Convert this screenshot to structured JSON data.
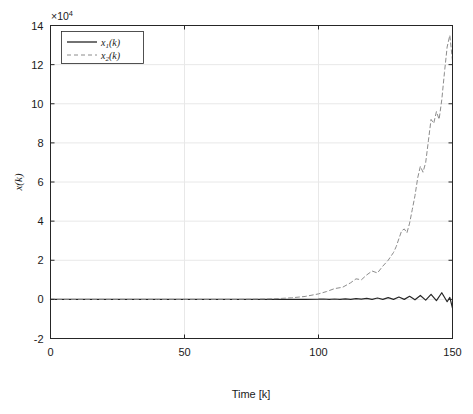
{
  "figure": {
    "background_color": "#ffffff",
    "axes_color": "#262626",
    "grid_color": "#e8e8e8"
  },
  "chart_data": {
    "type": "line",
    "title": "",
    "xlabel": "Time [k]",
    "ylabel": "x(k)",
    "y_exponent_label": "×10",
    "y_exponent_power": "4",
    "y_scale": 10000,
    "xlim": [
      0,
      150
    ],
    "ylim": [
      -2,
      14
    ],
    "xticks": [
      0,
      50,
      100,
      150
    ],
    "xtick_labels": [
      "0",
      "50",
      "100",
      "150"
    ],
    "yticks": [
      -2,
      0,
      2,
      4,
      6,
      8,
      10,
      12,
      14
    ],
    "ytick_labels": [
      "-2",
      "0",
      "2",
      "4",
      "6",
      "8",
      "10",
      "12",
      "14"
    ],
    "grid": true,
    "legend_position": "upper-left",
    "legend_entries": [
      {
        "label": "x₁(k)",
        "base": "x",
        "sub": "1",
        "tail": "(k)",
        "style": "solid",
        "color": "#262626"
      },
      {
        "label": "x₂(k)",
        "base": "x",
        "sub": "2",
        "tail": "(k)",
        "style": "dashed",
        "color": "#8c8c8c"
      }
    ],
    "series": [
      {
        "name": "x1(k)",
        "style": "solid",
        "color": "#262626",
        "x": [
          0,
          5,
          10,
          15,
          20,
          25,
          30,
          35,
          40,
          45,
          50,
          55,
          60,
          65,
          70,
          75,
          80,
          85,
          90,
          95,
          100,
          102,
          104,
          106,
          108,
          110,
          112,
          114,
          116,
          118,
          120,
          122,
          124,
          126,
          128,
          130,
          132,
          134,
          136,
          138,
          140,
          142,
          144,
          146,
          148,
          149,
          150
        ],
        "y": [
          0,
          0,
          0,
          0,
          0,
          0,
          0,
          0,
          0,
          0,
          0,
          0,
          0,
          0,
          0,
          0,
          0,
          0,
          0,
          0,
          0.01,
          0.02,
          0.0,
          0.02,
          0.0,
          0.03,
          0.0,
          0.04,
          0.01,
          0.05,
          0.0,
          0.07,
          0.0,
          0.09,
          0.0,
          0.12,
          0.0,
          0.16,
          -0.02,
          0.2,
          -0.04,
          0.26,
          -0.06,
          0.34,
          -0.12,
          0.1,
          -0.45
        ]
      },
      {
        "name": "x2(k)",
        "style": "dashed",
        "color": "#8c8c8c",
        "x": [
          0,
          10,
          20,
          30,
          40,
          50,
          60,
          70,
          80,
          85,
          90,
          95,
          100,
          103,
          106,
          109,
          112,
          114,
          116,
          118,
          120,
          122,
          124,
          126,
          128,
          129,
          130,
          131,
          132,
          133,
          134,
          135,
          136,
          137,
          138,
          139,
          140,
          141,
          142,
          143,
          144,
          145,
          146,
          147,
          148,
          149,
          150
        ],
        "y": [
          0,
          0,
          0,
          0,
          0,
          0,
          0,
          0,
          0.02,
          0.04,
          0.08,
          0.15,
          0.28,
          0.4,
          0.55,
          0.62,
          0.85,
          1.05,
          1.0,
          1.25,
          1.45,
          1.35,
          1.7,
          2.0,
          2.4,
          2.7,
          3.1,
          3.5,
          3.6,
          3.4,
          3.9,
          4.6,
          5.3,
          6.2,
          6.8,
          6.5,
          7.0,
          8.1,
          9.2,
          9.0,
          9.6,
          9.2,
          10.2,
          11.6,
          12.9,
          13.5,
          12.2
        ]
      }
    ]
  }
}
